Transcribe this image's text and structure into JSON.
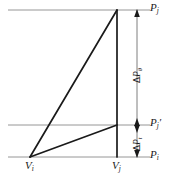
{
  "figure": {
    "type": "pressure-volume-schematic",
    "background_color": "#ffffff",
    "line_color_primary": "#1a1a1a",
    "line_color_reference": "#8a8a8a",
    "width": 169,
    "height": 182
  },
  "axis_labels": {
    "pressure_top": {
      "symbol": "P",
      "subscript": "j",
      "prime": "",
      "text": "Pj"
    },
    "pressure_middle": {
      "symbol": "P",
      "subscript": "j",
      "prime": "′",
      "text": "Pj′"
    },
    "pressure_bottom": {
      "symbol": "P",
      "subscript": "i",
      "prime": "",
      "text": "Pi"
    },
    "volume_left": {
      "symbol": "V",
      "subscript": "i",
      "text": "Vi"
    },
    "volume_right": {
      "symbol": "V",
      "subscript": "j",
      "text": "Vj"
    }
  },
  "dimension_labels": {
    "upper": {
      "delta": "Δ",
      "symbol": "P",
      "subscript": "θ",
      "text": "ΔPθ"
    },
    "lower": {
      "delta": "Δ",
      "symbol": "P",
      "subscript": "t",
      "text": "ΔPt"
    }
  },
  "reference_lines": [
    {
      "name": "top-pressure-line",
      "y": 10
    },
    {
      "name": "middle-pressure-line",
      "y": 125
    },
    {
      "name": "bottom-pressure-line",
      "y": 157
    }
  ],
  "geometry": {
    "vertex_vi": {
      "x": 30,
      "y": 157
    },
    "vertex_apex": {
      "x": 117,
      "y": 10
    },
    "vertex_mid": {
      "x": 117,
      "y": 125
    },
    "dimension_line_x": 137
  }
}
